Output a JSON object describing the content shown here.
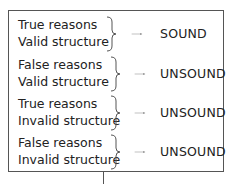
{
  "rows": [
    {
      "line1": "True reasons",
      "line2": "Valid structure",
      "result": "SOUND"
    },
    {
      "line1": "False reasons",
      "line2": "Valid structure",
      "result": "UNSOUND"
    },
    {
      "line1": "True reasons",
      "line2": "Invalid structure",
      "result": "UNSOUND"
    },
    {
      "line1": "False reasons",
      "line2": "Invalid structure",
      "result": "UNSOUND"
    }
  ],
  "colors": {
    "border": "#555555",
    "text": "#222222"
  }
}
